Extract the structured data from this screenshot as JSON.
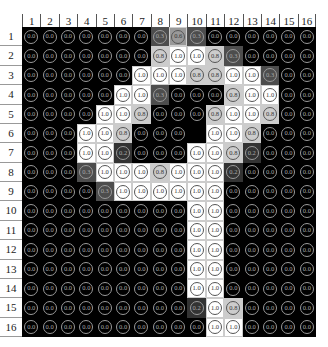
{
  "column_labels": [
    "1",
    "2",
    "3",
    "4",
    "5",
    "6",
    "7",
    "8",
    "9",
    "10",
    "11",
    "12",
    "13",
    "14",
    "15",
    "16"
  ],
  "row_labels": [
    "1",
    "2",
    "3",
    "4",
    "5",
    "6",
    "7",
    "8",
    "9",
    "10",
    "11",
    "12",
    "13",
    "14",
    "15",
    "16"
  ],
  "grid": [
    [
      0,
      0,
      0,
      0,
      0,
      0,
      0,
      0.3,
      0.6,
      0.3,
      0,
      0,
      0,
      0,
      0,
      0
    ],
    [
      0,
      0,
      0,
      0,
      0,
      0,
      0,
      0.8,
      1,
      1,
      0.8,
      0.3,
      0,
      0,
      0,
      0
    ],
    [
      0,
      0,
      0,
      0,
      0,
      0,
      1,
      1,
      1,
      0.8,
      0.8,
      1,
      1,
      0.3,
      0,
      0
    ],
    [
      0,
      0,
      0,
      0,
      0,
      1,
      1,
      0.3,
      0,
      0,
      0,
      0.8,
      1,
      1,
      0,
      0
    ],
    [
      0,
      0,
      0,
      0,
      1,
      1,
      0.8,
      0,
      0,
      0,
      0.8,
      1,
      1,
      0.8,
      0,
      0
    ],
    [
      0,
      0,
      0,
      1,
      1,
      0.8,
      0,
      0,
      0,
      null,
      1,
      1,
      0.8,
      0,
      0,
      0
    ],
    [
      0,
      0,
      0,
      1,
      1,
      0.2,
      0,
      0,
      0,
      1,
      1,
      0.8,
      0.2,
      0,
      0,
      0
    ],
    [
      0,
      0,
      0,
      0.3,
      1,
      1,
      1,
      0.8,
      1,
      1,
      1,
      0.2,
      0,
      0,
      0,
      0
    ],
    [
      0,
      0,
      0,
      0,
      0.3,
      1,
      1,
      1,
      1,
      1,
      1,
      0,
      0,
      0,
      0,
      0
    ],
    [
      0,
      0,
      0,
      0,
      0,
      0,
      0,
      0,
      0,
      1,
      1,
      0,
      0,
      0,
      0,
      0
    ],
    [
      0,
      0,
      0,
      0,
      0,
      0,
      0,
      0,
      0,
      1,
      1,
      0,
      0,
      0,
      0,
      0
    ],
    [
      0,
      0,
      0,
      0,
      0,
      0,
      0,
      0,
      0,
      1,
      1,
      0,
      0,
      0,
      0,
      0
    ],
    [
      0,
      0,
      0,
      0,
      0,
      0,
      0,
      0,
      0,
      1,
      1,
      0,
      0,
      0,
      0,
      0
    ],
    [
      0,
      0,
      0,
      0,
      0,
      0,
      0,
      0,
      0,
      1,
      1,
      0,
      0,
      0,
      0,
      0
    ],
    [
      0,
      0,
      0,
      0,
      0,
      0,
      0,
      0,
      0,
      0.2,
      1,
      0.8,
      0,
      0,
      0,
      0
    ],
    [
      0,
      0,
      0,
      0,
      0,
      0,
      0,
      0,
      0,
      0,
      1,
      1,
      0,
      0,
      0,
      0
    ]
  ],
  "depicts": "digit 9 pixel intensity grid (16x16)"
}
